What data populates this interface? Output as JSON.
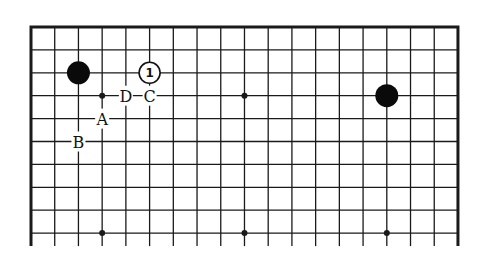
{
  "board": {
    "columns": 19,
    "rows_visible": 10,
    "open_edge": "bottom",
    "origin_px": [
      31,
      27
    ],
    "spacing_px": [
      23.72,
      22.9
    ],
    "bottom_extension_px": 13,
    "line_color": "#1a1a1a",
    "background_color": "#ffffff"
  },
  "star_points": [
    {
      "col": 3,
      "row": 3
    },
    {
      "col": 9,
      "row": 3
    },
    {
      "col": 15,
      "row": 3
    },
    {
      "col": 3,
      "row": 9
    },
    {
      "col": 9,
      "row": 9
    },
    {
      "col": 15,
      "row": 9
    }
  ],
  "stones": [
    {
      "color": "black",
      "col": 2,
      "row": 2,
      "number": ""
    },
    {
      "color": "white",
      "col": 5,
      "row": 2,
      "number": "1"
    },
    {
      "color": "black",
      "col": 15,
      "row": 3,
      "number": ""
    }
  ],
  "labels": [
    {
      "text": "D",
      "col": 4,
      "row": 3
    },
    {
      "text": "C",
      "col": 5,
      "row": 3
    },
    {
      "text": "A",
      "col": 3,
      "row": 4
    },
    {
      "text": "B",
      "col": 2,
      "row": 5
    }
  ]
}
